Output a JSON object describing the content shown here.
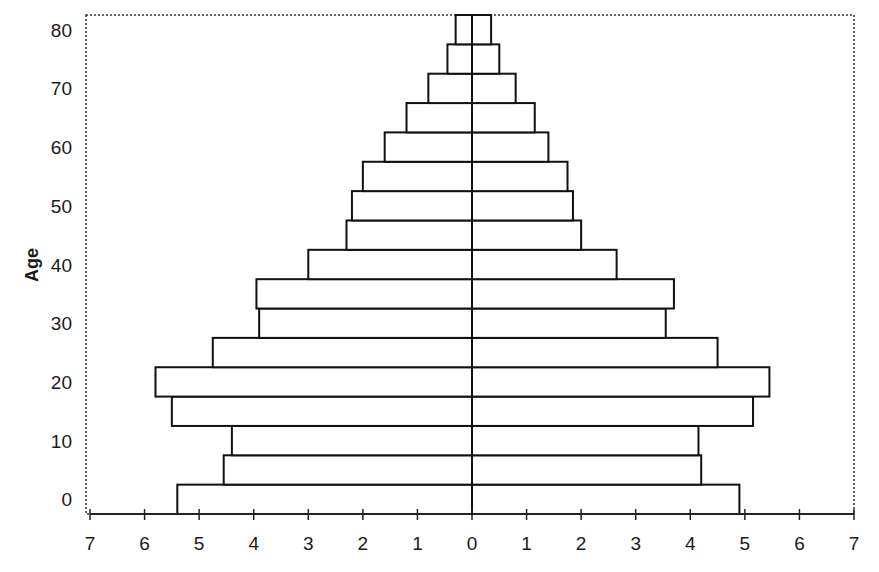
{
  "chart_data": {
    "type": "bar",
    "orientation": "horizontal",
    "subtype": "population-pyramid",
    "title": "",
    "xlabel": "",
    "ylabel": "Age",
    "xlim": [
      -7,
      7
    ],
    "ylim": [
      -2.5,
      82.5
    ],
    "x_tick_labels": [
      "7",
      "6",
      "5",
      "4",
      "3",
      "2",
      "1",
      "0",
      "1",
      "2",
      "3",
      "4",
      "5",
      "6",
      "7"
    ],
    "x_tick_values": [
      -7,
      -6,
      -5,
      -4,
      -3,
      -2,
      -1,
      0,
      1,
      2,
      3,
      4,
      5,
      6,
      7
    ],
    "y_tick_labels": [
      "0",
      "10",
      "20",
      "30",
      "40",
      "50",
      "60",
      "70",
      "80"
    ],
    "y_tick_values": [
      0,
      10,
      20,
      30,
      40,
      50,
      60,
      70,
      80
    ],
    "categories": [
      0,
      5,
      10,
      15,
      20,
      25,
      30,
      35,
      40,
      45,
      50,
      55,
      60,
      65,
      70,
      75,
      80
    ],
    "series": [
      {
        "name": "Left (negative side)",
        "side": "left",
        "values": [
          5.4,
          4.55,
          4.4,
          5.5,
          5.8,
          4.75,
          3.9,
          3.95,
          3.0,
          2.3,
          2.2,
          2.0,
          1.6,
          1.2,
          0.8,
          0.45,
          0.3
        ]
      },
      {
        "name": "Right (positive side)",
        "side": "right",
        "values": [
          4.9,
          4.2,
          4.15,
          5.15,
          5.45,
          4.5,
          3.55,
          3.7,
          2.65,
          2.0,
          1.85,
          1.75,
          1.4,
          1.15,
          0.8,
          0.5,
          0.35
        ]
      }
    ],
    "bar_fill": "#ffffff",
    "bar_stroke": "#111111",
    "grid": false,
    "legend": "none",
    "plot_border": "dotted"
  }
}
